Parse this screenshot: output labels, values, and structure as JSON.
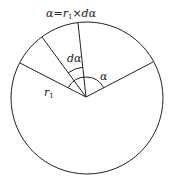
{
  "diagram": {
    "title_formula": "α=r₁×dα",
    "labels": {
      "formula_prefix": "α=r",
      "formula_sub": "1",
      "formula_suffix": "×dα",
      "d_alpha": "dα",
      "alpha": "α",
      "radius_main": "r",
      "radius_sub": "1"
    },
    "shapes": {
      "circle": {
        "cx": 87,
        "cy": 98,
        "r": 76
      },
      "center": {
        "x": 86,
        "y": 97
      },
      "radii": [
        {
          "name": "radius-right",
          "x2": 153,
          "y2": 62
        },
        {
          "name": "radius-top",
          "x2": 78,
          "y2": 23
        },
        {
          "name": "radius-upper-left",
          "x2": 42,
          "y2": 37
        },
        {
          "name": "radius-left",
          "x2": 20,
          "y2": 63
        }
      ]
    },
    "colors": {
      "stroke": "#222222",
      "background": "#ffffff"
    }
  }
}
